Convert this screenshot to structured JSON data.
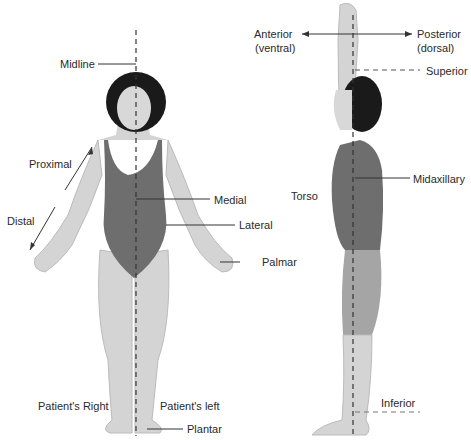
{
  "figure": {
    "colors": {
      "skin": "#d4d4d4",
      "suit": "#6e6e6e",
      "hair": "#1a1a1a",
      "line": "#333333",
      "background": "#ffffff"
    }
  },
  "front_view": {
    "labels": {
      "midline": "Midline",
      "proximal": "Proximal",
      "distal": "Distal",
      "medial": "Medial",
      "lateral": "Lateral",
      "palmar": "Palmar",
      "patient_right": "Patient's Right",
      "patient_left": "Patient's left",
      "plantar": "Plantar"
    }
  },
  "side_view": {
    "labels": {
      "anterior": "Anterior",
      "anterior_alt": "(ventral)",
      "posterior": "Posterior",
      "posterior_alt": "(dorsal)",
      "superior": "Superior",
      "torso": "Torso",
      "midaxillary": "Midaxillary",
      "inferior": "Inferior"
    }
  }
}
